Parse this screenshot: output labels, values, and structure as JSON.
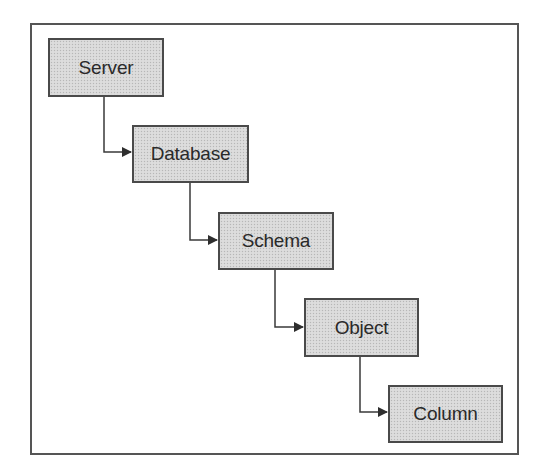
{
  "diagram": {
    "type": "hierarchy",
    "colors": {
      "frame_border": "#555555",
      "node_border": "#4a4a4a",
      "node_fill": "#d9d9d9",
      "text": "#2a2a2a",
      "connector": "#3a3a3a"
    },
    "nodes": [
      {
        "id": "server",
        "label": "Server"
      },
      {
        "id": "database",
        "label": "Database"
      },
      {
        "id": "schema",
        "label": "Schema"
      },
      {
        "id": "object",
        "label": "Object"
      },
      {
        "id": "column",
        "label": "Column"
      }
    ],
    "edges": [
      {
        "from": "server",
        "to": "database"
      },
      {
        "from": "database",
        "to": "schema"
      },
      {
        "from": "schema",
        "to": "object"
      },
      {
        "from": "object",
        "to": "column"
      }
    ]
  }
}
